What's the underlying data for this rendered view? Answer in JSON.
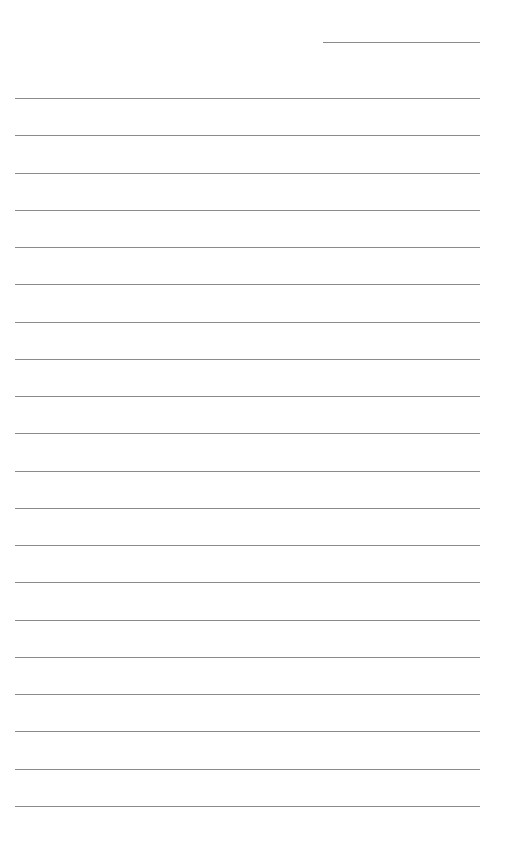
{
  "page": {
    "type": "lined-paper",
    "background": "#ffffff",
    "line_color": "#8a8a8a",
    "header_line": {
      "x": 323,
      "y": 42,
      "width": 157,
      "label": "date-line"
    },
    "rules": {
      "count": 20,
      "first_y": 98,
      "spacing": 37.26,
      "x": 15,
      "width": 465
    }
  }
}
